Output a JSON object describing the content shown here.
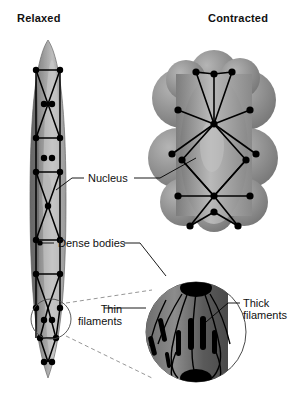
{
  "figure": {
    "type": "biology-diagram"
  },
  "titles": {
    "relaxed": "Relaxed",
    "contracted": "Contracted"
  },
  "labels": {
    "nucleus": "Nucleus",
    "dense_bodies": "Dense bodies",
    "thin_filaments_line1": "Thin",
    "thin_filaments_line2": "filaments",
    "thick_filaments_line1": "Thick",
    "thick_filaments_line2": "filaments"
  },
  "colors": {
    "background": "#ffffff",
    "text": "#111111",
    "cell_dark": "#6f6f6f",
    "cell_mid": "#8d8d8d",
    "cell_light": "#c9c9c9",
    "dense_body": "#000000",
    "leader_line": "#000000",
    "inset_outline": "#555555",
    "dashed_connector": "#777777"
  },
  "structures": {
    "relaxed_cell": "elongated spindle-shaped smooth muscle cell",
    "contracted_cell": "shortened lobed globular smooth muscle cell",
    "inset": "magnified circle showing thin and thick filaments anchored at dense bodies"
  }
}
